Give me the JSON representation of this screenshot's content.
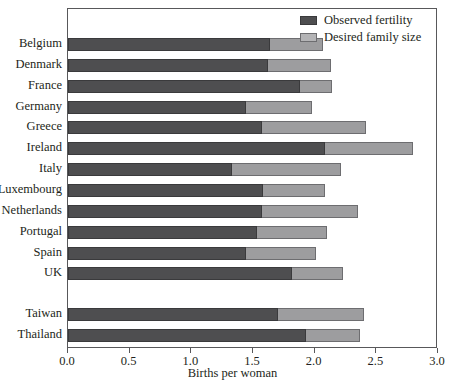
{
  "chart_data": {
    "type": "bar",
    "orientation": "horizontal",
    "title": "",
    "xlabel": "Births per woman",
    "ylabel": "",
    "xlim": [
      0.0,
      3.0
    ],
    "xticks": [
      "0.0",
      "0.5",
      "1.0",
      "1.5",
      "2.0",
      "2.5",
      "3.0"
    ],
    "xtick_values": [
      0.0,
      0.5,
      1.0,
      1.5,
      2.0,
      2.5,
      3.0
    ],
    "grid": false,
    "legend_position": "top-right",
    "categories": [
      "Belgium",
      "Denmark",
      "France",
      "Germany",
      "Greece",
      "Ireland",
      "Italy",
      "Luxembourg",
      "Netherlands",
      "Portugal",
      "Spain",
      "UK",
      "Taiwan",
      "Thailand"
    ],
    "group_breaks": [
      12
    ],
    "series": [
      {
        "name": "Observed fertility",
        "color": "#4e4e50",
        "values": [
          1.64,
          1.62,
          1.88,
          1.44,
          1.57,
          2.08,
          1.33,
          1.58,
          1.57,
          1.53,
          1.44,
          1.82,
          1.7,
          1.93
        ]
      },
      {
        "name": "Desired family size",
        "color": "#b4b4b6",
        "values": [
          2.07,
          2.13,
          2.14,
          1.98,
          2.42,
          2.8,
          2.21,
          2.08,
          2.35,
          2.1,
          2.01,
          2.23,
          2.4,
          2.37
        ]
      }
    ]
  },
  "legend": {
    "entries": [
      {
        "label": "Observed fertility",
        "swatch": "observed-swatch"
      },
      {
        "label": "Desired family size",
        "swatch": "desired-swatch"
      }
    ]
  },
  "axis": {
    "x_title": "Births per woman"
  }
}
